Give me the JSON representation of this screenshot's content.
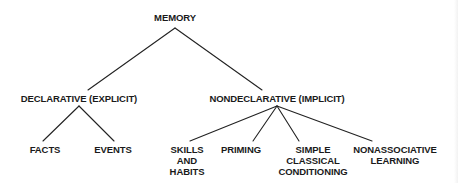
{
  "diagram": {
    "type": "tree",
    "root": {
      "label": "MEMORY",
      "children": [
        {
          "label": "DECLARATIVE (EXPLICIT)",
          "children": [
            {
              "label": "FACTS"
            },
            {
              "label": "EVENTS"
            }
          ]
        },
        {
          "label": "NONDECLARATIVE (IMPLICIT)",
          "children": [
            {
              "label": "SKILLS AND HABITS",
              "lines": [
                "SKILLS",
                "AND",
                "HABITS"
              ]
            },
            {
              "label": "PRIMING"
            },
            {
              "label": "SIMPLE CLASSICAL CONDITIONING",
              "lines": [
                "SIMPLE",
                "CLASSICAL",
                "CONDITIONING"
              ]
            },
            {
              "label": "NONASSOCIATIVE LEARNING",
              "lines": [
                "NONASSOCIATIVE",
                "LEARNING"
              ]
            }
          ]
        }
      ]
    },
    "line_color": "#222222",
    "text_color": "#1a1a1a",
    "background": "#ffffff"
  }
}
